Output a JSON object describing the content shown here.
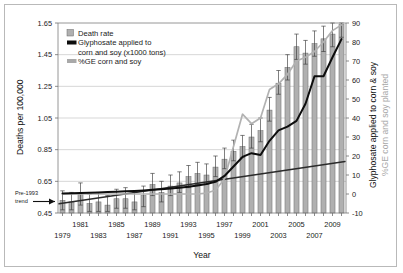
{
  "figure": {
    "border_color": "#b9b9b9",
    "background": "#ffffff"
  },
  "axis_titles": {
    "left": "Deaths per 100,000",
    "bottom": "Year",
    "right_black": "Glyphosate applied to corn & soy",
    "right_gray": "%GE corn and soy planted"
  },
  "legend": {
    "items": [
      {
        "label": "Death rate",
        "type": "bar-swatch",
        "color": "#b0b0b0"
      },
      {
        "label": "Glyphosate applied to",
        "type": "line-swatch",
        "color": "#0d0d0d"
      },
      {
        "label": "corn and soy (x1000 tons)",
        "type": "continuation",
        "color": "#0d0d0d"
      },
      {
        "label": "%GE corn and soy",
        "type": "line-swatch",
        "color": "#b2b2b2"
      }
    ]
  },
  "annotation": {
    "line1": "Pre-1993",
    "line2": "trend",
    "arrow": "arrow-right"
  },
  "chart_data": {
    "type": "bar",
    "title": "",
    "xlabel": "Year",
    "ylabel": "Deaths per 100,000",
    "y2label": "Glyphosate applied to corn & soy / %GE corn and soy planted",
    "ylim": [
      0.45,
      1.65
    ],
    "y2lim": [
      -10,
      90
    ],
    "xlim": [
      1978.5,
      2010.5
    ],
    "grid": true,
    "legend_position": "top-left",
    "yticks": [
      0.45,
      0.65,
      0.85,
      1.05,
      1.25,
      1.45,
      1.65
    ],
    "y2ticks": [
      -10,
      0,
      10,
      20,
      30,
      40,
      50,
      60,
      70,
      80,
      90
    ],
    "categories": [
      1979,
      1980,
      1981,
      1982,
      1983,
      1984,
      1985,
      1986,
      1987,
      1988,
      1989,
      1990,
      1991,
      1992,
      1993,
      1994,
      1995,
      1996,
      1997,
      1998,
      1999,
      2000,
      2001,
      2002,
      2003,
      2004,
      2005,
      2006,
      2007,
      2008,
      2009,
      2010
    ],
    "xtick_labels_row1": [
      1981,
      1985,
      1989,
      1993,
      1997,
      2001,
      2005,
      2009
    ],
    "xtick_labels_row2": [
      1979,
      1983,
      1987,
      1991,
      1995,
      1999,
      2003,
      2007
    ],
    "series": [
      {
        "name": "Death rate",
        "axis": "left",
        "type": "bar",
        "color": "#b0b0b0",
        "values": [
          0.53,
          0.52,
          0.57,
          0.51,
          0.52,
          0.5,
          0.54,
          0.54,
          0.52,
          0.56,
          0.63,
          0.58,
          0.62,
          0.64,
          0.68,
          0.7,
          0.69,
          0.74,
          0.79,
          0.84,
          0.87,
          0.93,
          0.97,
          1.1,
          1.27,
          1.37,
          1.5,
          1.46,
          1.52,
          1.55,
          1.58,
          1.64
        ],
        "error_low": [
          0.47,
          0.47,
          0.5,
          0.46,
          0.46,
          0.46,
          0.48,
          0.48,
          0.47,
          0.49,
          0.56,
          0.52,
          0.56,
          0.58,
          0.61,
          0.63,
          0.63,
          0.68,
          0.73,
          0.78,
          0.8,
          0.86,
          0.9,
          1.03,
          1.2,
          1.29,
          1.42,
          1.39,
          1.44,
          1.47,
          1.5,
          1.56
        ],
        "error_high": [
          0.59,
          0.58,
          0.64,
          0.57,
          0.58,
          0.56,
          0.6,
          0.61,
          0.58,
          0.62,
          0.7,
          0.65,
          0.69,
          0.71,
          0.75,
          0.77,
          0.76,
          0.81,
          0.86,
          0.91,
          0.94,
          1.01,
          1.05,
          1.18,
          1.35,
          1.45,
          1.58,
          1.54,
          1.6,
          1.63,
          1.66,
          1.72
        ]
      },
      {
        "name": "Glyphosate applied to corn and soy (x1000 tons)",
        "axis": "right",
        "type": "line",
        "color": "#0d0d0d",
        "values": [
          0.3,
          0.4,
          0.5,
          0.6,
          0.8,
          1.0,
          1.2,
          1.4,
          1.6,
          1.9,
          2.2,
          2.5,
          2.9,
          3.3,
          3.8,
          4.5,
          5.3,
          6.4,
          9.5,
          14.5,
          19.5,
          21.5,
          20.5,
          28.0,
          33.5,
          35.5,
          38.5,
          47.5,
          62.0,
          62.0,
          72.0,
          81.5
        ]
      },
      {
        "name": "%GE corn and soy",
        "axis": "right",
        "type": "line",
        "color": "#b2b2b2",
        "values": [
          0,
          0,
          0,
          0,
          0,
          0,
          0,
          0,
          0,
          0,
          0,
          0,
          0,
          0,
          0,
          0,
          0.5,
          2.0,
          8.0,
          25.0,
          42.0,
          37.0,
          40.0,
          55.0,
          58.0,
          63.0,
          70.0,
          72.0,
          75.0,
          80.0,
          86.0,
          89.0
        ]
      },
      {
        "name": "Pre-1993 trend",
        "axis": "left",
        "type": "trendline",
        "color": "#2b2b2b",
        "start": {
          "x": 1978.6,
          "y": 0.508
        },
        "end": {
          "x": 2010.4,
          "y": 0.775
        }
      }
    ]
  }
}
